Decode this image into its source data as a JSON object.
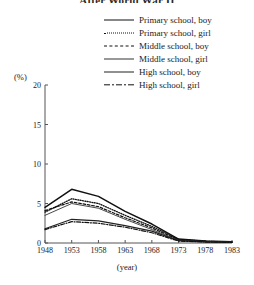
{
  "title": "After World War II",
  "chart_data": {
    "type": "line",
    "title": "After World War II",
    "xlabel": "(year)",
    "ylabel": "(%)",
    "ylim": [
      0,
      20
    ],
    "yticks": [
      0,
      5,
      10,
      15,
      20
    ],
    "grid": false,
    "legend_position": "top-right",
    "x": [
      1948,
      1953,
      1958,
      1963,
      1968,
      1973,
      1978,
      1983
    ],
    "categories": [
      "1948",
      "1953",
      "1958",
      "1963",
      "1968",
      "1973",
      "1978",
      "1983"
    ],
    "series": [
      {
        "name": "Primary school, boy",
        "style": "solid-thick",
        "values": [
          4.5,
          6.8,
          5.9,
          4.0,
          2.4,
          0.5,
          0.25,
          0.15
        ]
      },
      {
        "name": "Primary school, girl",
        "style": "dotted",
        "values": [
          3.9,
          5.6,
          5.0,
          3.5,
          2.1,
          0.45,
          0.22,
          0.12
        ]
      },
      {
        "name": "Middle school, boy",
        "style": "dashed",
        "values": [
          4.1,
          5.2,
          4.6,
          3.2,
          1.9,
          0.4,
          0.2,
          0.12
        ]
      },
      {
        "name": "Middle school, girl",
        "style": "solid-thin",
        "values": [
          3.5,
          5.0,
          4.4,
          3.0,
          1.7,
          0.35,
          0.18,
          0.1
        ]
      },
      {
        "name": "High school, boy",
        "style": "solid-med",
        "values": [
          1.8,
          3.0,
          2.8,
          2.2,
          1.5,
          0.3,
          0.15,
          0.1
        ]
      },
      {
        "name": "High school, girl",
        "style": "dashdot",
        "values": [
          1.7,
          2.7,
          2.5,
          2.0,
          1.3,
          0.25,
          0.12,
          0.08
        ]
      }
    ]
  },
  "colors": {
    "line": "#111111",
    "axis": "#555555",
    "text": "#1a1a1a",
    "background": "#ffffff"
  }
}
